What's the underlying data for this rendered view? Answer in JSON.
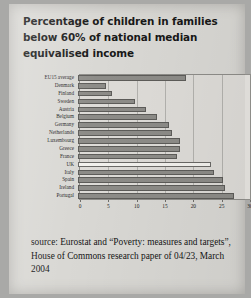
{
  "document": {
    "title": "Percentage of children in families below 60% of national median equivalised income",
    "source_note": "source: Eurostat and “Poverty: measures and targets”, House of Commons research paper of 04/23, March 2004"
  },
  "chart_data": {
    "type": "bar",
    "orientation": "horizontal",
    "title": "Percentage of children in families below 60% of national median equivalised income",
    "xlabel": "",
    "ylabel": "",
    "xlim": [
      0,
      30
    ],
    "xticks": [
      0,
      5,
      10,
      15,
      20,
      25,
      30
    ],
    "xtick_labels": [
      "0",
      "5",
      "10",
      "15",
      "20",
      "25",
      "30"
    ],
    "grid": true,
    "legend": "none",
    "bar_color": "#8d8c88",
    "highlight_color": "#f3f2ee",
    "highlight_category": "UK",
    "categories": [
      "EU15 average",
      "Denmark",
      "Finland",
      "Sweden",
      "Austria",
      "Belgium",
      "Germany",
      "Netherlands",
      "Luxembourg",
      "Greece",
      "France",
      "UK",
      "Italy",
      "Spain",
      "Ireland",
      "Portugal"
    ],
    "values": [
      19,
      5,
      6,
      10,
      12,
      14,
      16,
      16.5,
      18,
      18,
      17.5,
      23.5,
      24,
      25.5,
      26,
      27.5
    ]
  }
}
